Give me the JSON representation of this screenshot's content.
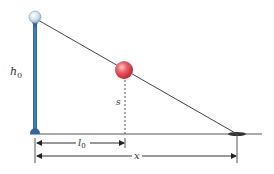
{
  "diagram": {
    "labels": {
      "lamp_height": "h",
      "lamp_height_sub": "0",
      "ball_height": "s",
      "ball_distance": "l",
      "ball_distance_sub": "0",
      "shadow_distance": "x"
    },
    "colors": {
      "pole": "#3a73ae",
      "lamp_globe": "#d6e6f2",
      "ball": "#e04a55",
      "lines": "#444444",
      "shadow": "#333333",
      "background": "#ffffff"
    },
    "elements": {
      "lamp_post": "lamp-post",
      "ball": "ball",
      "light_ray": "light-ray",
      "ground": "ground-line",
      "shadow": "shadow-tip"
    }
  }
}
